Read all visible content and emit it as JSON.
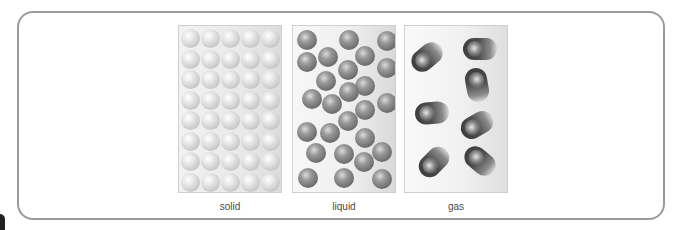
{
  "figure": {
    "panels": [
      {
        "id": "solid",
        "label": "solid",
        "particle_style": "light-gray spheres in close-packed grid",
        "grid": {
          "rows": 8,
          "cols": 5
        }
      },
      {
        "id": "liquid",
        "label": "liquid",
        "particle_style": "dark-gray spheres loosely packed",
        "count": 26
      },
      {
        "id": "gas",
        "label": "gas",
        "particle_style": "dark motion-blurred spheres, widely spaced",
        "count": 7
      }
    ],
    "colors": {
      "frame_border": "#9a9a9a",
      "panel_border": "#cfcfcf",
      "solid_particle": "#d0d0d0",
      "liquid_particle": "#6e6e6e",
      "gas_particle": "#3d3d3d",
      "label_text": "#4a4a4a"
    }
  }
}
